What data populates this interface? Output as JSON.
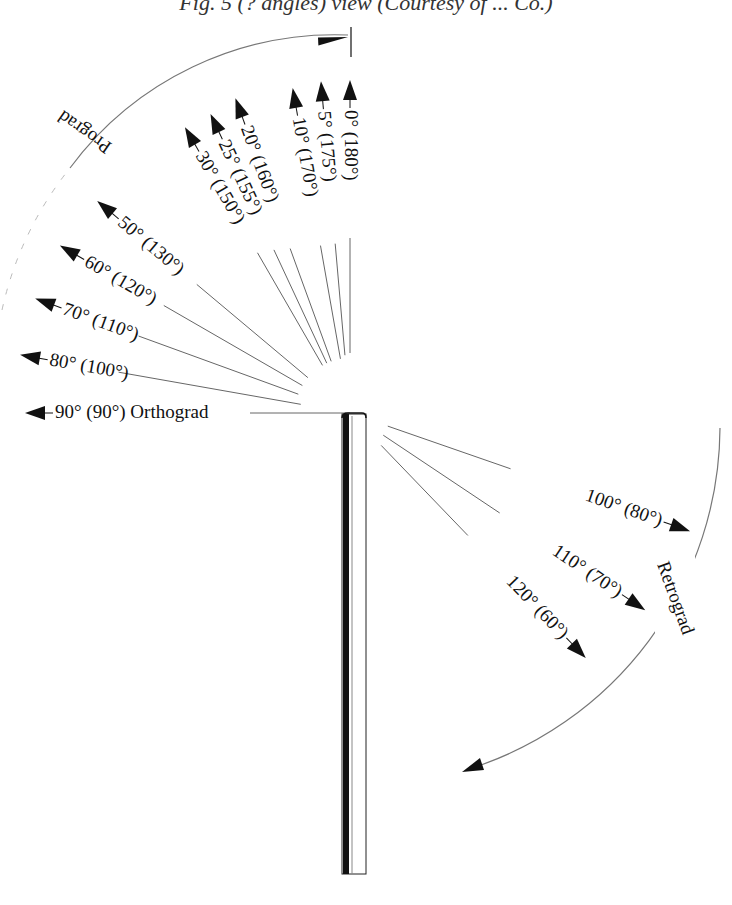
{
  "title": "Fig. 5 (? angles) view (Courtesy of ... Co.)",
  "center": {
    "x": 350,
    "y": 413
  },
  "prograd_label": "Prograd",
  "retrograd_label": "Retrograd",
  "rays": [
    {
      "label": "0° (180°)",
      "angle": 0,
      "side": "prograd"
    },
    {
      "label": "5° (175°)",
      "angle": 5,
      "side": "prograd"
    },
    {
      "label": "10° (170°)",
      "angle": 10,
      "side": "prograd"
    },
    {
      "label": "20° (160°)",
      "angle": 20,
      "side": "prograd"
    },
    {
      "label": "25° (155°)",
      "angle": 25,
      "side": "prograd"
    },
    {
      "label": "30° (150°)",
      "angle": 30,
      "side": "prograd"
    },
    {
      "label": "50° (130°)",
      "angle": 50,
      "side": "prograd"
    },
    {
      "label": "60° (120°)",
      "angle": 60,
      "side": "prograd"
    },
    {
      "label": "70° (110°)",
      "angle": 70,
      "side": "prograd"
    },
    {
      "label": "80° (100°)",
      "angle": 80,
      "side": "prograd"
    },
    {
      "label": "90° (90°) Orthograd",
      "angle": 90,
      "side": "prograd"
    },
    {
      "label": "100° (80°)",
      "angle": 100,
      "side": "retrograd"
    },
    {
      "label": "110° (70°)",
      "angle": 110,
      "side": "retrograd"
    },
    {
      "label": "120° (60°)",
      "angle": 120,
      "side": "retrograd"
    }
  ],
  "colors": {
    "ink": "#111111",
    "line": "#555555",
    "arc": "#777777"
  }
}
